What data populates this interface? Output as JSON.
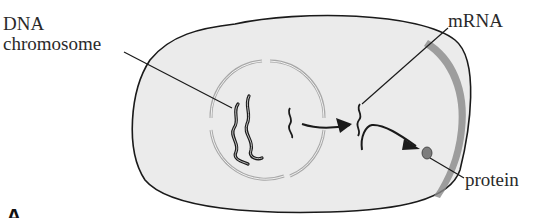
{
  "diagram": {
    "labels": {
      "dna_line1": "DNA",
      "dna_line2": "chromosome",
      "mrna": "mRNA",
      "protein": "protein",
      "panel": "A"
    },
    "colors": {
      "cell_fill": "#ebebeb",
      "cell_outline": "#1a1a1a",
      "nucleus_membrane": "#a8a8a8",
      "membrane_shading": "#8a8a8a",
      "ink": "#1a1a1a",
      "protein_fill": "#7d7d7d"
    }
  }
}
